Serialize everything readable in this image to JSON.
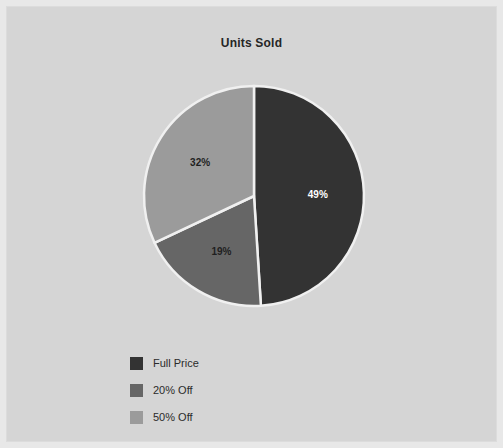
{
  "panel": {
    "background": "#d5d5d5",
    "frame": "#e8e8e8"
  },
  "chart_data": {
    "type": "pie",
    "title": "Units Sold",
    "xlabel": "",
    "ylabel": "",
    "categories": [
      "Full Price",
      "20% Off",
      "50% Off"
    ],
    "values": [
      49,
      19,
      32
    ],
    "value_labels": [
      "49%",
      "19%",
      "32%"
    ],
    "colors": [
      "#333333",
      "#666666",
      "#9b9b9b"
    ],
    "label_colors": [
      "#ffffff",
      "#1f1f1f",
      "#1f1f1f"
    ],
    "start_angle_deg": 0,
    "direction": "clockwise",
    "separator_color": "#f0f0f0",
    "legend_position": "bottom-left",
    "grid": false,
    "legend": [
      {
        "label": "Full Price",
        "color": "#333333",
        "value": 49
      },
      {
        "label": "20% Off",
        "color": "#666666",
        "value": 19
      },
      {
        "label": "50% Off",
        "color": "#9b9b9b",
        "value": 32
      }
    ]
  }
}
